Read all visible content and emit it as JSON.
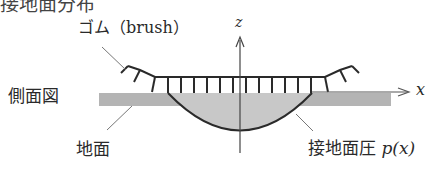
{
  "title_partial": "接地面分布",
  "labels": {
    "rubber": "ゴム（brush）",
    "side_view": "側面図",
    "ground": "地面",
    "pressure": "接地面圧",
    "pressure_func": "p(x)",
    "x_axis": "x",
    "z_axis": "z"
  },
  "colors": {
    "ground_fill": "#b4b4b4",
    "pressure_fill": "#c8c8c8",
    "line": "#2a2a2a",
    "leader": "#777777"
  }
}
